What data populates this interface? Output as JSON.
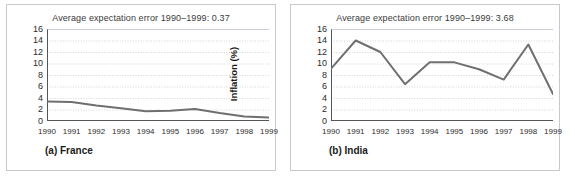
{
  "figure": {
    "background_color": "#ffffff",
    "border_color": "#c9c9c9",
    "line_color": "#6f6f6f",
    "grid_color": "#c7c7d8",
    "axis_color": "#555555"
  },
  "panels": [
    {
      "id": "panel-a",
      "title": "Average expectation error 1990–1999: 0.37",
      "caption": "(a) France",
      "chart_data": {
        "type": "line",
        "title": "Average expectation error 1990–1999: 0.37",
        "subtitle": "(a) France",
        "xlabel": "",
        "ylabel": "Inflation (%)",
        "x": [
          1990,
          1991,
          1992,
          1993,
          1994,
          1995,
          1996,
          1997,
          1998,
          1999
        ],
        "xticklabels": [
          "1990",
          "1991",
          "1992",
          "1993",
          "1994",
          "1995",
          "1996",
          "1997",
          "1998",
          "1999"
        ],
        "values": [
          3.4,
          3.3,
          2.7,
          2.2,
          1.7,
          1.8,
          2.1,
          1.4,
          0.8,
          0.6
        ],
        "series": [
          {
            "name": "Inflation",
            "values": [
              3.4,
              3.3,
              2.7,
              2.2,
              1.7,
              1.8,
              2.1,
              1.4,
              0.8,
              0.6
            ]
          }
        ],
        "ylim": [
          0,
          16
        ],
        "yticks": [
          0,
          2,
          4,
          6,
          8,
          10,
          12,
          14,
          16
        ],
        "yticklabels": [
          "0",
          "2",
          "4",
          "6",
          "8",
          "10",
          "12",
          "14",
          "16"
        ],
        "grid": true,
        "legend": false,
        "annotation": "Average expectation error 1990–1999: 0.37"
      }
    },
    {
      "id": "panel-b",
      "title": "Average expectation error 1990–1999: 3.68",
      "caption": "(b) India",
      "chart_data": {
        "type": "line",
        "title": "Average expectation error 1990–1999: 3.68",
        "subtitle": "(b) India",
        "xlabel": "",
        "ylabel": "Inflation (%)",
        "x": [
          1990,
          1991,
          1992,
          1993,
          1994,
          1995,
          1996,
          1997,
          1998,
          1999
        ],
        "xticklabels": [
          "1990",
          "1991",
          "1992",
          "1993",
          "1994",
          "1995",
          "1996",
          "1997",
          "1998",
          "1999"
        ],
        "values": [
          9.1,
          14.0,
          12.0,
          6.4,
          10.2,
          10.2,
          9.0,
          7.2,
          13.3,
          4.7
        ],
        "series": [
          {
            "name": "Inflation",
            "values": [
              9.1,
              14.0,
              12.0,
              6.4,
              10.2,
              10.2,
              9.0,
              7.2,
              13.3,
              4.7
            ]
          }
        ],
        "ylim": [
          0,
          16
        ],
        "yticks": [
          0,
          2,
          4,
          6,
          8,
          10,
          12,
          14,
          16
        ],
        "yticklabels": [
          "0",
          "2",
          "4",
          "6",
          "8",
          "10",
          "12",
          "14",
          "16"
        ],
        "grid": true,
        "legend": false,
        "annotation": "Average expectation error 1990–1999: 3.68"
      }
    }
  ],
  "chart_data": [
    {
      "type": "line",
      "title": "Average expectation error 1990–1999: 0.37",
      "subtitle": "(a) France",
      "ylabel": "Inflation (%)",
      "categories": [
        "1990",
        "1991",
        "1992",
        "1993",
        "1994",
        "1995",
        "1996",
        "1997",
        "1998",
        "1999"
      ],
      "values": [
        3.4,
        3.3,
        2.7,
        2.2,
        1.7,
        1.8,
        2.1,
        1.4,
        0.8,
        0.6
      ],
      "ylim": [
        0,
        16
      ],
      "grid": true,
      "legend": false
    },
    {
      "type": "line",
      "title": "Average expectation error 1990–1999: 3.68",
      "subtitle": "(b) India",
      "ylabel": "Inflation (%)",
      "categories": [
        "1990",
        "1991",
        "1992",
        "1993",
        "1994",
        "1995",
        "1996",
        "1997",
        "1998",
        "1999"
      ],
      "values": [
        9.1,
        14.0,
        12.0,
        6.4,
        10.2,
        10.2,
        9.0,
        7.2,
        13.3,
        4.7
      ],
      "ylim": [
        0,
        16
      ],
      "grid": true,
      "legend": false
    }
  ]
}
